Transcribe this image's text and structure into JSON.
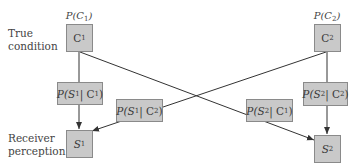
{
  "labels": {
    "row_top": [
      "True",
      "condition"
    ],
    "row_bottom": [
      "Receiver",
      "perception"
    ]
  },
  "priors": {
    "c1": {
      "p": "P(",
      "v": "C",
      "sub": "1",
      "close": ")"
    },
    "c2": {
      "p": "P(",
      "v": "C",
      "sub": "2",
      "close": ")"
    }
  },
  "nodes": {
    "c1": {
      "v": "C",
      "sub": "1"
    },
    "c2": {
      "v": "C",
      "sub": "2"
    },
    "s1": {
      "v": "S",
      "sub": "1"
    },
    "s2": {
      "v": "S",
      "sub": "2"
    }
  },
  "edges": {
    "s1c1": {
      "pre": "P(S",
      "s": "1",
      "mid": " | C",
      "c": "1",
      "post": ")"
    },
    "s1c2": {
      "pre": "P(S",
      "s": "1",
      "mid": " | C",
      "c": "2",
      "post": ")"
    },
    "s2c1": {
      "pre": "P(S",
      "s": "2",
      "mid": " | C",
      "c": "1",
      "post": ")"
    },
    "s2c2": {
      "pre": "P(S",
      "s": "2",
      "mid": " | C",
      "c": "2",
      "post": ")"
    }
  },
  "colors": {
    "box_fill": "#c9c9c9",
    "box_border": "#8a8a8a",
    "line": "#333333"
  }
}
